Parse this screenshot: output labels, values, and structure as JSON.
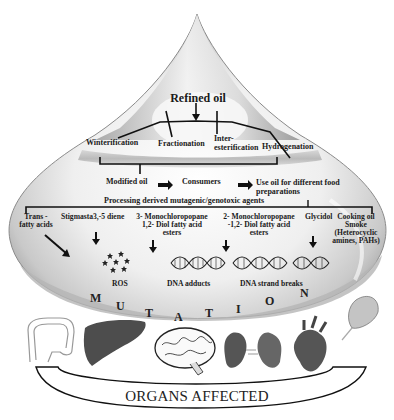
{
  "drop": {
    "top_label": "Refined oil",
    "processes": [
      "Winterification",
      "Fractionation",
      "Inter-\nesterification",
      "Hydrogenation"
    ],
    "flow": [
      "Modified oil",
      "Consumers",
      "Use oil for different food preparations"
    ],
    "agents_heading": "Processing derived mutagenic/genotoxic agents",
    "agents": [
      {
        "label": "Trans - fatty acids"
      },
      {
        "label": "Stigmasta3,-5 diene"
      },
      {
        "label": "3- Monochloropopane 1,2- Diol fatty acid esters"
      },
      {
        "label": "2- Monochloropopane -1,2- Diol fatty acid esters"
      },
      {
        "label": "Glycidol"
      },
      {
        "label": "Cooking oil Smoke (Heterocyclic amines, PAHs)"
      }
    ],
    "effects": [
      "ROS",
      "DNA adducts",
      "DNA strand breaks"
    ],
    "mutation_letters": [
      "M",
      "U",
      "T",
      "A",
      "T",
      "I",
      "O",
      "N"
    ]
  },
  "organs": {
    "items": [
      "colon-icon",
      "liver-icon",
      "brain-icon",
      "kidney-icon",
      "heart-icon",
      "stomach-icon"
    ],
    "label": "ORGANS AFFECTED"
  },
  "colors": {
    "drop_light": "#f4f4f4",
    "drop_mid": "#c8c8c8",
    "drop_dark": "#8a8a8a",
    "ink": "#1a1a1a"
  }
}
